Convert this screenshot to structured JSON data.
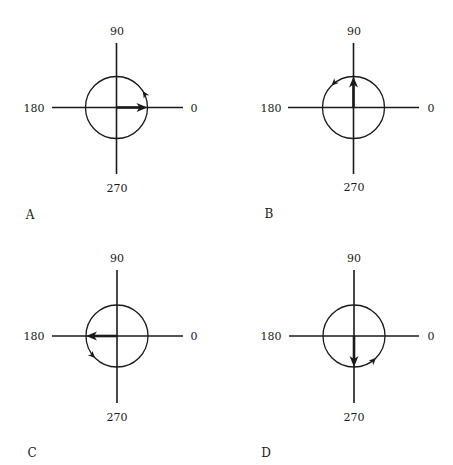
{
  "figure": {
    "width": 453,
    "height": 465,
    "background": "#ffffff",
    "ink": "#1a1a1a",
    "circle_radius": 31,
    "panels": [
      {
        "id": "A",
        "label": "A",
        "label_pos": [
          30,
          219
        ],
        "center": [
          116.5,
          107.5
        ],
        "h_axis": [
          52,
          183
        ],
        "v_axis": [
          43,
          174
        ],
        "axis_labels": {
          "top": "90",
          "left": "180",
          "right": "0",
          "bottom": "270"
        },
        "top_label_pos": [
          117,
          35
        ],
        "bottom_label_pos": [
          117,
          192
        ],
        "left_label_pos": [
          34,
          112
        ],
        "right_label_pos": [
          194,
          112
        ],
        "vector_angle_deg": 0,
        "rotation_marker_angle_deg": 32,
        "rotation_direction": "counterclockwise"
      },
      {
        "id": "B",
        "label": "B",
        "label_pos": [
          269,
          218
        ],
        "center": [
          353.5,
          107.5
        ],
        "h_axis": [
          288,
          419
        ],
        "v_axis": [
          43,
          174
        ],
        "axis_labels": {
          "top": "90",
          "left": "180",
          "right": "0",
          "bottom": "270"
        },
        "top_label_pos": [
          354,
          35
        ],
        "bottom_label_pos": [
          354,
          191
        ],
        "left_label_pos": [
          271,
          112
        ],
        "right_label_pos": [
          431,
          112
        ],
        "vector_angle_deg": 90,
        "rotation_marker_angle_deg": 135,
        "rotation_direction": "counterclockwise"
      },
      {
        "id": "C",
        "label": "C",
        "label_pos": [
          32,
          457
        ],
        "center": [
          117,
          336
        ],
        "h_axis": [
          52,
          183
        ],
        "v_axis": [
          270,
          403
        ],
        "axis_labels": {
          "top": "90",
          "left": "180",
          "right": "0",
          "bottom": "270"
        },
        "top_label_pos": [
          117,
          262
        ],
        "bottom_label_pos": [
          117,
          421
        ],
        "left_label_pos": [
          34,
          340
        ],
        "right_label_pos": [
          194,
          340
        ],
        "vector_angle_deg": 180,
        "rotation_marker_angle_deg": 225,
        "rotation_direction": "counterclockwise"
      },
      {
        "id": "D",
        "label": "D",
        "label_pos": [
          266,
          457
        ],
        "center": [
          354,
          336
        ],
        "h_axis": [
          289,
          419
        ],
        "v_axis": [
          270,
          403
        ],
        "axis_labels": {
          "top": "90",
          "left": "180",
          "right": "0",
          "bottom": "270"
        },
        "top_label_pos": [
          354,
          262
        ],
        "bottom_label_pos": [
          354,
          421
        ],
        "left_label_pos": [
          271,
          340
        ],
        "right_label_pos": [
          431,
          340
        ],
        "vector_angle_deg": 270,
        "rotation_marker_angle_deg": 315,
        "rotation_direction": "counterclockwise"
      }
    ]
  }
}
